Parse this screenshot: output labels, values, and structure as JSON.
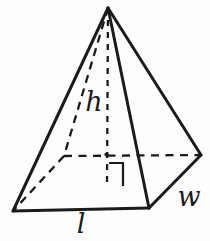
{
  "figure": {
    "name": "rectangular-pyramid-with-height",
    "stroke_color": "#1b1b1b",
    "background": "#fdfdfd",
    "canvas": {
      "width": 210,
      "height": 241
    },
    "vertices": {
      "apex": [
        108,
        8
      ],
      "front_left": [
        13,
        211
      ],
      "front_right": [
        149,
        208
      ],
      "back_right": [
        201,
        155
      ],
      "back_left": [
        64,
        156
      ],
      "base_center": [
        107,
        186
      ]
    },
    "edges": [
      {
        "from": "apex",
        "to": "front_left",
        "style": "solid",
        "dash": null
      },
      {
        "from": "apex",
        "to": "front_right",
        "style": "solid",
        "dash": null
      },
      {
        "from": "apex",
        "to": "back_right",
        "style": "solid",
        "dash": null
      },
      {
        "from": "front_left",
        "to": "front_right",
        "style": "solid",
        "dash": null
      },
      {
        "from": "front_right",
        "to": "back_right",
        "style": "solid",
        "dash": null
      },
      {
        "from": "apex",
        "to": "back_left",
        "style": "dashed",
        "dash": "8 6"
      },
      {
        "from": "back_left",
        "to": "back_right",
        "style": "dashed",
        "dash": "8 6.5"
      },
      {
        "from": "back_left",
        "to": "front_left",
        "style": "dashed",
        "dash": "8 6"
      },
      {
        "from": "apex",
        "to": "base_center",
        "style": "dashed",
        "dash": "6 6"
      }
    ],
    "right_angle_marker": {
      "points": [
        [
          109,
          163
        ],
        [
          123,
          163
        ],
        [
          123,
          186
        ]
      ]
    },
    "intersection_dot": {
      "x": 106.5,
      "y": 154.5,
      "r": 2.1
    },
    "labels": [
      {
        "id": "height",
        "text": "h",
        "x": 94,
        "y": 111
      },
      {
        "id": "width",
        "text": "w",
        "x": 189,
        "y": 206
      },
      {
        "id": "length",
        "text": "l",
        "x": 81,
        "y": 233
      }
    ]
  }
}
